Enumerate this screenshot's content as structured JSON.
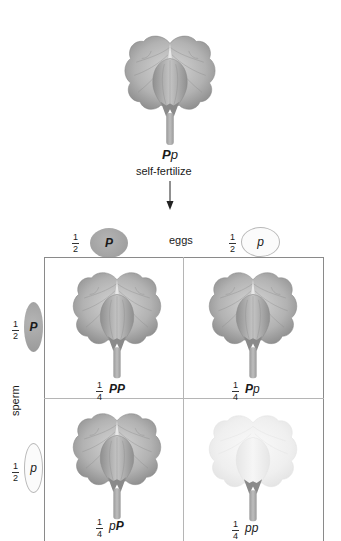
{
  "parent": {
    "genotype_dominant": "P",
    "genotype_recessive": "p",
    "action_label": "self-fertilize",
    "arrow_icon": "down-arrow",
    "phenotype": "purple"
  },
  "eggs": {
    "label": "eggs",
    "gametes": [
      {
        "fraction_num": "1",
        "fraction_den": "2",
        "allele": "P",
        "dominant": true,
        "color": "#a6a6a6"
      },
      {
        "fraction_num": "1",
        "fraction_den": "2",
        "allele": "p",
        "dominant": false,
        "color": "#fbfbfb"
      }
    ]
  },
  "sperm": {
    "label": "sperm",
    "gametes": [
      {
        "fraction_num": "1",
        "fraction_den": "2",
        "allele": "P",
        "dominant": true,
        "color": "#a6a6a6"
      },
      {
        "fraction_num": "1",
        "fraction_den": "2",
        "allele": "p",
        "dominant": false,
        "color": "#fbfbfb"
      }
    ]
  },
  "punnett": {
    "cells": [
      {
        "fraction_num": "1",
        "fraction_den": "4",
        "allele1": "P",
        "allele2": "P",
        "a1_dom": true,
        "a2_dom": true,
        "phenotype": "purple"
      },
      {
        "fraction_num": "1",
        "fraction_den": "4",
        "allele1": "P",
        "allele2": "p",
        "a1_dom": true,
        "a2_dom": false,
        "phenotype": "purple"
      },
      {
        "fraction_num": "1",
        "fraction_den": "4",
        "allele1": "p",
        "allele2": "P",
        "a1_dom": false,
        "a2_dom": true,
        "phenotype": "purple"
      },
      {
        "fraction_num": "1",
        "fraction_den": "4",
        "allele1": "p",
        "allele2": "p",
        "a1_dom": false,
        "a2_dom": false,
        "phenotype": "white"
      }
    ]
  },
  "colors": {
    "purple_petal_light": "#c8c8c8",
    "purple_petal_dark": "#8e8e8e",
    "white_petal_light": "#f4f4f4",
    "white_petal_dark": "#e2e2e2",
    "stem": "#a8a8a8",
    "grid_line": "#8a8a8a"
  }
}
